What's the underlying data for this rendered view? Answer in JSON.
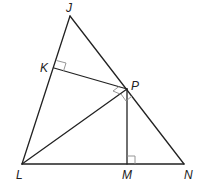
{
  "diagram": {
    "type": "geometry-triangle",
    "colors": {
      "line": "#222222",
      "right_angle_marker": "#8a8a8a",
      "background": "#ffffff"
    },
    "points": {
      "J": {
        "label": "J",
        "x": 70,
        "y": 16
      },
      "K": {
        "label": "K",
        "x": 54,
        "y": 68
      },
      "P": {
        "label": "P",
        "x": 127,
        "y": 89
      },
      "L": {
        "label": "L",
        "x": 22,
        "y": 164
      },
      "M": {
        "label": "M",
        "x": 127,
        "y": 164
      },
      "N": {
        "label": "N",
        "x": 184,
        "y": 164
      }
    },
    "segments": [
      "JL",
      "JN",
      "LN",
      "KP",
      "LP",
      "PM"
    ],
    "right_angles": [
      "JKP",
      "PMN",
      "LPN",
      "KPJ"
    ]
  }
}
